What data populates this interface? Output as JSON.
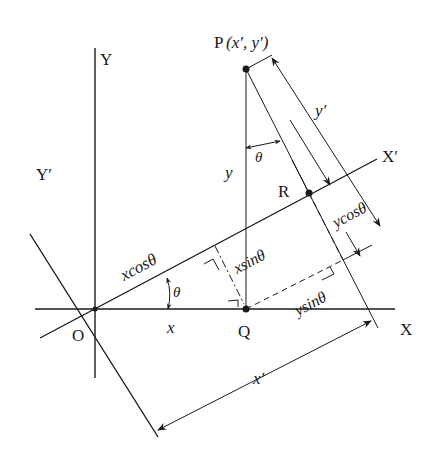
{
  "diagram": {
    "axes": {
      "x": "X",
      "y": "Y",
      "x_prime": "X′",
      "y_prime": "Y′"
    },
    "points": {
      "origin": "O",
      "p": "P",
      "p_coords": "(x′, y′)",
      "q": "Q",
      "r": "R"
    },
    "labels": {
      "x": "x",
      "y": "y",
      "x_prime_len": "x′",
      "y_prime_len": "y′",
      "x_cos": "xcosθ",
      "x_sin": "xsinθ",
      "y_cos": "ycosθ",
      "y_sin": "ysinθ",
      "theta_origin": "θ",
      "theta_p": "θ"
    }
  }
}
